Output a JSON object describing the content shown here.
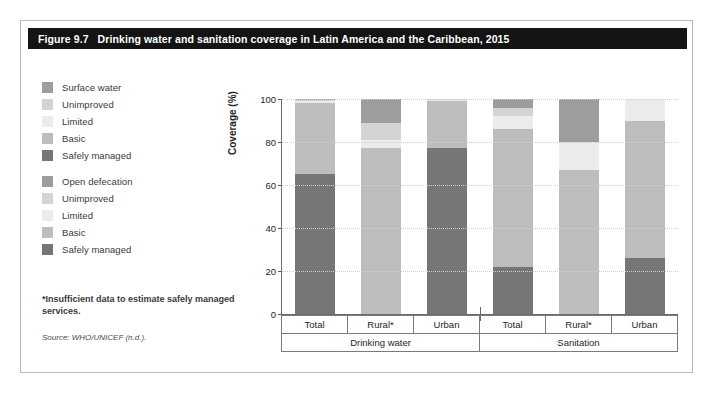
{
  "figure": {
    "number": "Figure 9.7",
    "title": "Drinking water and sanitation coverage in Latin America and the Caribbean, 2015",
    "footnote": "*Insufficient data to estimate safely managed services.",
    "source": "Source: WHO/UNICEF (n.d.)."
  },
  "legend": {
    "drinking_water": [
      {
        "label": "Surface water",
        "color": "#9d9d9d"
      },
      {
        "label": "Unimproved",
        "color": "#d4d4d4"
      },
      {
        "label": "Limited",
        "color": "#ececec"
      },
      {
        "label": "Basic",
        "color": "#bdbdbd"
      },
      {
        "label": "Safely managed",
        "color": "#767676"
      }
    ],
    "sanitation": [
      {
        "label": "Open defecation",
        "color": "#9d9d9d"
      },
      {
        "label": "Unimproved",
        "color": "#d4d4d4"
      },
      {
        "label": "Limited",
        "color": "#ececec"
      },
      {
        "label": "Basic",
        "color": "#bdbdbd"
      },
      {
        "label": "Safely managed",
        "color": "#767676"
      }
    ]
  },
  "chart_data": {
    "type": "bar",
    "subtype": "stacked-bar",
    "title": "Drinking water and sanitation coverage in Latin America and the Caribbean, 2015",
    "xlabel": "",
    "ylabel": "Coverage (%)",
    "ylim": [
      0,
      100
    ],
    "yticks": [
      0,
      20,
      40,
      60,
      80,
      100
    ],
    "grid": "horizontal-dotted",
    "legend_position": "left-outside",
    "groups": [
      {
        "name": "Drinking water",
        "categories": [
          "Total",
          "Rural*",
          "Urban"
        ]
      },
      {
        "name": "Sanitation",
        "categories": [
          "Total",
          "Rural*",
          "Urban"
        ]
      }
    ],
    "categories": [
      "Total",
      "Rural*",
      "Urban",
      "Total",
      "Rural*",
      "Urban"
    ],
    "stack_order_bottom_to_top": [
      "Safely managed",
      "Basic",
      "Limited",
      "Unimproved",
      "Surface water / Open defecation"
    ],
    "series": [
      {
        "name": "Safely managed",
        "color": "#767676",
        "values": [
          65,
          0,
          77,
          22,
          0,
          26
        ]
      },
      {
        "name": "Basic",
        "color": "#bdbdbd",
        "values": [
          33,
          77,
          22,
          64,
          67,
          64
        ]
      },
      {
        "name": "Limited",
        "color": "#ececec",
        "values": [
          1,
          4,
          0.5,
          6,
          13,
          10
        ]
      },
      {
        "name": "Unimproved",
        "color": "#d4d4d4",
        "values": [
          0.6,
          8,
          0.3,
          4,
          0,
          0
        ]
      },
      {
        "name": "Surface water / Open defecation",
        "color": "#9d9d9d",
        "values": [
          0.4,
          11,
          0.2,
          4,
          20,
          0
        ]
      }
    ],
    "bars": [
      {
        "group": "Drinking water",
        "category": "Total",
        "segments": [
          {
            "name": "Safely managed",
            "value": 65,
            "color": "#767676"
          },
          {
            "name": "Basic",
            "value": 33,
            "color": "#bdbdbd"
          },
          {
            "name": "Limited",
            "value": 1,
            "color": "#ececec"
          },
          {
            "name": "Unimproved",
            "value": 0.6,
            "color": "#d4d4d4"
          },
          {
            "name": "Surface water",
            "value": 0.4,
            "color": "#9d9d9d"
          }
        ]
      },
      {
        "group": "Drinking water",
        "category": "Rural*",
        "segments": [
          {
            "name": "Safely managed",
            "value": 0,
            "color": "#767676"
          },
          {
            "name": "Basic",
            "value": 77,
            "color": "#bdbdbd"
          },
          {
            "name": "Limited",
            "value": 4,
            "color": "#ececec"
          },
          {
            "name": "Unimproved",
            "value": 8,
            "color": "#d4d4d4"
          },
          {
            "name": "Surface water",
            "value": 11,
            "color": "#9d9d9d"
          }
        ]
      },
      {
        "group": "Drinking water",
        "category": "Urban",
        "segments": [
          {
            "name": "Safely managed",
            "value": 77,
            "color": "#767676"
          },
          {
            "name": "Basic",
            "value": 22,
            "color": "#bdbdbd"
          },
          {
            "name": "Limited",
            "value": 0.5,
            "color": "#ececec"
          },
          {
            "name": "Unimproved",
            "value": 0.3,
            "color": "#d4d4d4"
          },
          {
            "name": "Surface water",
            "value": 0.2,
            "color": "#9d9d9d"
          }
        ]
      },
      {
        "group": "Sanitation",
        "category": "Total",
        "segments": [
          {
            "name": "Safely managed",
            "value": 22,
            "color": "#767676"
          },
          {
            "name": "Basic",
            "value": 64,
            "color": "#bdbdbd"
          },
          {
            "name": "Limited",
            "value": 6,
            "color": "#ececec"
          },
          {
            "name": "Unimproved",
            "value": 4,
            "color": "#d4d4d4"
          },
          {
            "name": "Open defecation",
            "value": 4,
            "color": "#9d9d9d"
          }
        ]
      },
      {
        "group": "Sanitation",
        "category": "Rural*",
        "segments": [
          {
            "name": "Safely managed",
            "value": 0,
            "color": "#767676"
          },
          {
            "name": "Basic",
            "value": 67,
            "color": "#bdbdbd"
          },
          {
            "name": "Limited",
            "value": 13,
            "color": "#ececec"
          },
          {
            "name": "Unimproved",
            "value": 0,
            "color": "#d4d4d4"
          },
          {
            "name": "Open defecation",
            "value": 20,
            "color": "#9d9d9d"
          }
        ]
      },
      {
        "group": "Sanitation",
        "category": "Urban",
        "segments": [
          {
            "name": "Safely managed",
            "value": 26,
            "color": "#767676"
          },
          {
            "name": "Basic",
            "value": 64,
            "color": "#bdbdbd"
          },
          {
            "name": "Limited",
            "value": 10,
            "color": "#ececec"
          },
          {
            "name": "Unimproved",
            "value": 0,
            "color": "#d4d4d4"
          },
          {
            "name": "Open defecation",
            "value": 0,
            "color": "#9d9d9d"
          }
        ]
      }
    ]
  }
}
